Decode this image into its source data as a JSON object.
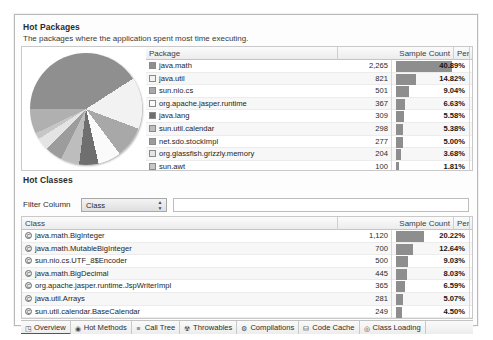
{
  "packages_section": {
    "title": "Hot Packages",
    "subtitle": "The packages where the application spent most time executing.",
    "columns": [
      "Package",
      "Sample Count",
      "Percentage"
    ],
    "rows": [
      {
        "swatch": "#8f8f8f",
        "name": "java.math",
        "count": "2,265",
        "pct": "40.89%",
        "pct_value": 40.89
      },
      {
        "swatch": "#f2f2f2",
        "name": "java.util",
        "count": "821",
        "pct": "14.82%",
        "pct_value": 14.82
      },
      {
        "swatch": "#a8a8a8",
        "name": "sun.nio.cs",
        "count": "501",
        "pct": "9.04%",
        "pct_value": 9.04
      },
      {
        "swatch": "#fafafa",
        "name": "org.apache.jasper.runtime",
        "count": "367",
        "pct": "6.63%",
        "pct_value": 6.63
      },
      {
        "swatch": "#6f6f6f",
        "name": "java.lang",
        "count": "309",
        "pct": "5.58%",
        "pct_value": 5.58
      },
      {
        "swatch": "#bdbdbd",
        "name": "sun.util.calendar",
        "count": "298",
        "pct": "5.38%",
        "pct_value": 5.38
      },
      {
        "swatch": "#9c9c9c",
        "name": "net.sdo.stockImpl",
        "count": "277",
        "pct": "5.00%",
        "pct_value": 5.0
      },
      {
        "swatch": "#e4e4e4",
        "name": "org.glassfish.grizzly.memory",
        "count": "204",
        "pct": "3.68%",
        "pct_value": 3.68
      },
      {
        "swatch": "#c6c6c6",
        "name": "sun.awt",
        "count": "100",
        "pct": "1.81%",
        "pct_value": 1.81
      }
    ]
  },
  "classes_section": {
    "title": "Hot Classes",
    "filter_label": "Filter Column",
    "filter_select_value": "Class",
    "filter_input_value": "",
    "columns": [
      "Class",
      "Sample Count",
      "Percentage"
    ],
    "rows": [
      {
        "name": "java.math.BigInteger",
        "count": "1,120",
        "pct": "20.22%",
        "pct_value": 20.22
      },
      {
        "name": "java.math.MutableBigInteger",
        "count": "700",
        "pct": "12.64%",
        "pct_value": 12.64
      },
      {
        "name": "sun.nio.cs.UTF_8$Encoder",
        "count": "500",
        "pct": "9.03%",
        "pct_value": 9.03
      },
      {
        "name": "java.math.BigDecimal",
        "count": "445",
        "pct": "8.03%",
        "pct_value": 8.03
      },
      {
        "name": "org.apache.jasper.runtime.JspWriterImpl",
        "count": "365",
        "pct": "6.59%",
        "pct_value": 6.59
      },
      {
        "name": "java.util.Arrays",
        "count": "281",
        "pct": "5.07%",
        "pct_value": 5.07
      },
      {
        "name": "sun.util.calendar.BaseCalendar",
        "count": "249",
        "pct": "4.50%",
        "pct_value": 4.5
      },
      {
        "name": "java.util.TreeMap",
        "count": "244",
        "pct": "4.41%",
        "pct_value": 4.41
      }
    ]
  },
  "tabs": [
    {
      "label": "Overview",
      "icon": "chart-icon",
      "glyph": "◳",
      "active": true
    },
    {
      "label": "Hot Methods",
      "icon": "target-icon",
      "glyph": "◉",
      "active": false
    },
    {
      "label": "Call Tree",
      "icon": "list-tree-icon",
      "glyph": "≡",
      "active": false
    },
    {
      "label": "Throwables",
      "icon": "warning-icon",
      "glyph": "☢",
      "active": false
    },
    {
      "label": "Compilations",
      "icon": "gear-icon",
      "glyph": "⚙",
      "active": false
    },
    {
      "label": "Code Cache",
      "icon": "database-icon",
      "glyph": "⛁",
      "active": false
    },
    {
      "label": "Class Loading",
      "icon": "class-circle-icon",
      "glyph": "◎",
      "active": false
    }
  ],
  "chart_data": {
    "type": "pie",
    "title": "Hot Packages",
    "labels": [
      "java.math",
      "java.util",
      "sun.nio.cs",
      "org.apache.jasper.runtime",
      "java.lang",
      "sun.util.calendar",
      "net.sdo.stockImpl",
      "org.glassfish.grizzly.memory",
      "sun.awt",
      "other"
    ],
    "values": [
      40.89,
      14.82,
      9.04,
      6.63,
      5.58,
      5.38,
      5.0,
      3.68,
      1.81,
      7.17
    ],
    "colors": [
      "#8f8f8f",
      "#f2f2f2",
      "#a8a8a8",
      "#fafafa",
      "#6f6f6f",
      "#bdbdbd",
      "#9c9c9c",
      "#e4e4e4",
      "#c6c6c6",
      "#b0b0b0"
    ],
    "unit": "percent",
    "legend": "table-right"
  },
  "layout": {
    "pkg_col_x": {
      "name": 128,
      "count_right": 372,
      "bar_start": 376,
      "pct_right": 450
    },
    "cls_col_x": {
      "name": 4,
      "count_right": 372,
      "bar_start": 376,
      "pct_right": 450
    }
  }
}
